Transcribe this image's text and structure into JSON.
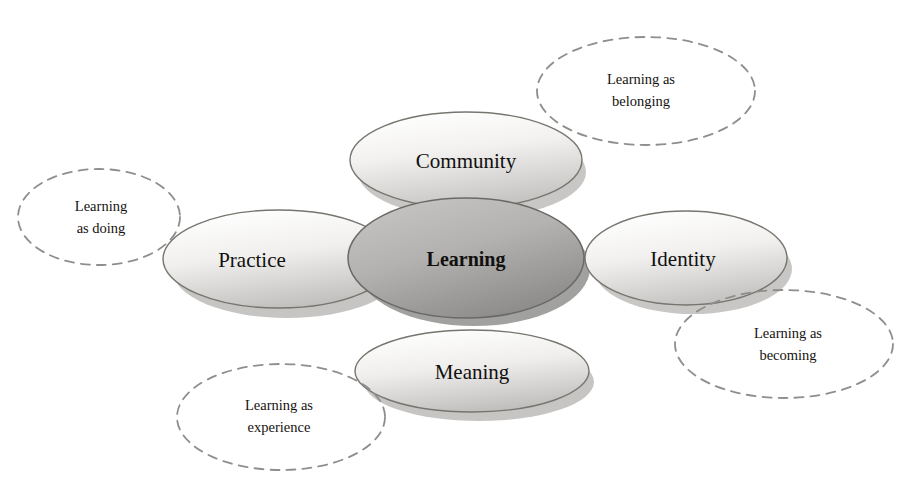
{
  "diagram": {
    "type": "concept-diagram",
    "background_color": "#ffffff",
    "center_node": {
      "label": "Learning",
      "fill_light": "#b9b8b6",
      "fill_dark": "#8e8d8b",
      "stroke": "#6f6e6c",
      "cx": 466,
      "cy": 258,
      "rx": 118,
      "ry": 60
    },
    "nodes": [
      {
        "id": "community",
        "label": "Community",
        "cx": 466,
        "cy": 160,
        "rx": 116,
        "ry": 48,
        "fill_light": "#ffffff",
        "fill_dark": "#c9c8c6",
        "stroke": "#7b7a78"
      },
      {
        "id": "practice",
        "label": "Practice",
        "cx": 279,
        "cy": 259,
        "rx": 116,
        "ry": 49,
        "fill_light": "#ffffff",
        "fill_dark": "#c7c6c4",
        "stroke": "#7b7a78"
      },
      {
        "id": "identity",
        "label": "Identity",
        "cx": 686,
        "cy": 258,
        "rx": 101,
        "ry": 47,
        "fill_light": "#ffffff",
        "fill_dark": "#c9c8c6",
        "stroke": "#7b7a78"
      },
      {
        "id": "meaning",
        "label": "Meaning",
        "cx": 472,
        "cy": 371,
        "rx": 117,
        "ry": 41,
        "fill_light": "#ffffff",
        "fill_dark": "#c6c5c3",
        "stroke": "#7b7a78"
      }
    ],
    "callouts": [
      {
        "id": "belonging",
        "lines": [
          "Learning as",
          "belonging"
        ],
        "cx": 646,
        "cy": 91,
        "rx": 109,
        "ry": 54,
        "stroke": "#8f8e8c",
        "dash": "9 7"
      },
      {
        "id": "doing",
        "lines": [
          "Learning",
          "as doing"
        ],
        "cx": 99,
        "cy": 217,
        "rx": 81,
        "ry": 48,
        "stroke": "#8f8e8c",
        "dash": "9 7"
      },
      {
        "id": "experience",
        "lines": [
          "Learning as",
          "experience"
        ],
        "cx": 281,
        "cy": 417,
        "rx": 104,
        "ry": 53,
        "stroke": "#8f8e8c",
        "dash": "9 7"
      },
      {
        "id": "becoming",
        "lines": [
          "Learning as",
          "becoming"
        ],
        "cx": 784,
        "cy": 344,
        "rx": 109,
        "ry": 54,
        "stroke": "#8f8e8c",
        "dash": "9 7"
      }
    ]
  }
}
